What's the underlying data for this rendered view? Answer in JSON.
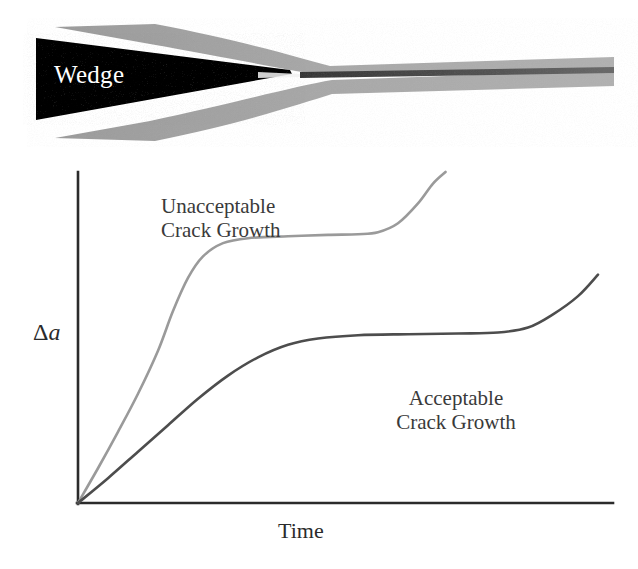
{
  "figure": {
    "wedge_label": "Wedge",
    "axis": {
      "y_label_delta": "Δ",
      "y_label_variable": "a",
      "x_label": "Time"
    },
    "annotations": [
      {
        "id": "unacceptable",
        "line1": "Unacceptable",
        "line2": "Crack Growth"
      },
      {
        "id": "acceptable",
        "line1": "Acceptable",
        "line2": "Crack Growth"
      }
    ],
    "colors": {
      "wedge_fill": "#0a0a0a",
      "adherend_gray": "#a8a8a8",
      "bondline_dark": "#4a4a4a",
      "axis": "#2b2b2b",
      "curve_unacceptable": "#9a9a9a",
      "curve_acceptable": "#4d4d4d",
      "background": "#ffffff"
    }
  },
  "chart_data": {
    "type": "line",
    "title": "",
    "xlabel": "Time",
    "ylabel": "Δa",
    "xlim": [
      0,
      1
    ],
    "ylim": [
      0,
      1
    ],
    "grid": false,
    "axis_ticks": false,
    "legend": "inline-annotations",
    "series": [
      {
        "name": "Unacceptable Crack Growth",
        "color": "#9a9a9a",
        "points": [
          [
            0.0,
            0.0
          ],
          [
            0.04,
            0.105
          ],
          [
            0.08,
            0.215
          ],
          [
            0.12,
            0.33
          ],
          [
            0.16,
            0.46
          ],
          [
            0.19,
            0.58
          ],
          [
            0.22,
            0.68
          ],
          [
            0.25,
            0.745
          ],
          [
            0.29,
            0.785
          ],
          [
            0.34,
            0.8
          ],
          [
            0.42,
            0.806
          ],
          [
            0.5,
            0.81
          ],
          [
            0.56,
            0.812
          ],
          [
            0.6,
            0.818
          ],
          [
            0.64,
            0.845
          ],
          [
            0.68,
            0.905
          ],
          [
            0.71,
            0.965
          ],
          [
            0.735,
            1.0
          ]
        ]
      },
      {
        "name": "Acceptable Crack Growth",
        "color": "#4d4d4d",
        "points": [
          [
            0.0,
            0.0
          ],
          [
            0.06,
            0.075
          ],
          [
            0.12,
            0.155
          ],
          [
            0.18,
            0.235
          ],
          [
            0.24,
            0.315
          ],
          [
            0.3,
            0.385
          ],
          [
            0.36,
            0.44
          ],
          [
            0.42,
            0.478
          ],
          [
            0.48,
            0.497
          ],
          [
            0.56,
            0.507
          ],
          [
            0.66,
            0.51
          ],
          [
            0.76,
            0.512
          ],
          [
            0.84,
            0.515
          ],
          [
            0.9,
            0.53
          ],
          [
            0.95,
            0.57
          ],
          [
            1.0,
            0.625
          ],
          [
            1.04,
            0.69
          ]
        ]
      }
    ]
  }
}
